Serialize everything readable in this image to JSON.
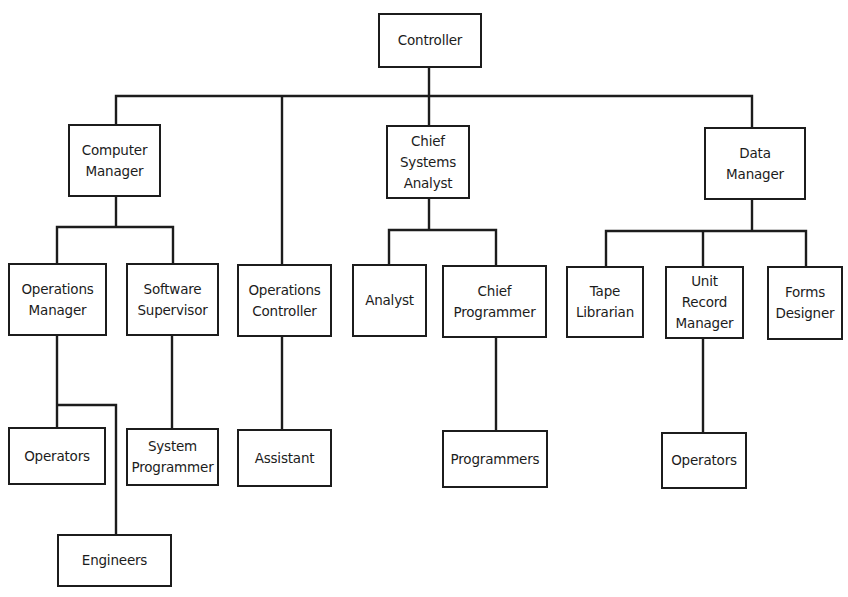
{
  "colors": {
    "line": "#1c1c1c",
    "box_border": "#1c1c1c",
    "text": "#1c1c1c",
    "background": "#ffffff"
  },
  "nodes": [
    {
      "id": "controller",
      "label": "Controller",
      "x": 378,
      "y": 13,
      "w": 104,
      "h": 55
    },
    {
      "id": "computer-manager",
      "label": "Computer\nManager",
      "x": 68,
      "y": 124,
      "w": 93,
      "h": 73
    },
    {
      "id": "chief-systems-analyst",
      "label": "Chief\nSystems\nAnalyst",
      "x": 386,
      "y": 125,
      "w": 84,
      "h": 74
    },
    {
      "id": "data-manager",
      "label": "Data\nManager",
      "x": 704,
      "y": 127,
      "w": 102,
      "h": 73
    },
    {
      "id": "operations-manager",
      "label": "Operations\nManager",
      "x": 8,
      "y": 263,
      "w": 99,
      "h": 73
    },
    {
      "id": "software-supervisor",
      "label": "Software\nSupervisor",
      "x": 126,
      "y": 263,
      "w": 93,
      "h": 73
    },
    {
      "id": "operations-controller",
      "label": "Operations\nController",
      "x": 237,
      "y": 264,
      "w": 95,
      "h": 73
    },
    {
      "id": "analyst",
      "label": "Analyst",
      "x": 352,
      "y": 264,
      "w": 75,
      "h": 73
    },
    {
      "id": "chief-programmer",
      "label": "Chief\nProgrammer",
      "x": 442,
      "y": 265,
      "w": 105,
      "h": 73
    },
    {
      "id": "tape-librarian",
      "label": "Tape\nLibrarian",
      "x": 566,
      "y": 266,
      "w": 78,
      "h": 72
    },
    {
      "id": "unit-record-manager",
      "label": "Unit\nRecord\nManager",
      "x": 665,
      "y": 266,
      "w": 79,
      "h": 73
    },
    {
      "id": "forms-designer",
      "label": "Forms\nDesigner",
      "x": 767,
      "y": 266,
      "w": 76,
      "h": 74
    },
    {
      "id": "operators-computer",
      "label": "Operators",
      "x": 8,
      "y": 427,
      "w": 98,
      "h": 58
    },
    {
      "id": "system-programmer",
      "label": "System\nProgrammer",
      "x": 126,
      "y": 428,
      "w": 93,
      "h": 58
    },
    {
      "id": "assistant",
      "label": "Assistant",
      "x": 237,
      "y": 429,
      "w": 95,
      "h": 58
    },
    {
      "id": "programmers",
      "label": "Programmers",
      "x": 442,
      "y": 430,
      "w": 106,
      "h": 58
    },
    {
      "id": "operators-data",
      "label": "Operators",
      "x": 661,
      "y": 432,
      "w": 86,
      "h": 57
    },
    {
      "id": "engineers",
      "label": "Engineers",
      "x": 57,
      "y": 534,
      "w": 115,
      "h": 53
    }
  ],
  "edges": [
    {
      "from": "controller",
      "to": "computer-manager"
    },
    {
      "from": "controller",
      "to": "operations-controller"
    },
    {
      "from": "controller",
      "to": "chief-systems-analyst"
    },
    {
      "from": "controller",
      "to": "data-manager"
    },
    {
      "from": "computer-manager",
      "to": "operations-manager"
    },
    {
      "from": "computer-manager",
      "to": "software-supervisor"
    },
    {
      "from": "operations-manager",
      "to": "operators-computer"
    },
    {
      "from": "operations-manager",
      "to": "engineers"
    },
    {
      "from": "software-supervisor",
      "to": "system-programmer"
    },
    {
      "from": "operations-controller",
      "to": "assistant"
    },
    {
      "from": "chief-systems-analyst",
      "to": "analyst"
    },
    {
      "from": "chief-systems-analyst",
      "to": "chief-programmer"
    },
    {
      "from": "chief-programmer",
      "to": "programmers"
    },
    {
      "from": "data-manager",
      "to": "tape-librarian"
    },
    {
      "from": "data-manager",
      "to": "unit-record-manager"
    },
    {
      "from": "data-manager",
      "to": "forms-designer"
    },
    {
      "from": "unit-record-manager",
      "to": "operators-data"
    }
  ],
  "connector_polylines": [
    [
      [
        429,
        68
      ],
      [
        429,
        96
      ]
    ],
    [
      [
        116,
        124
      ],
      [
        116,
        96
      ],
      [
        752,
        96
      ],
      [
        752,
        127
      ]
    ],
    [
      [
        282,
        96
      ],
      [
        282,
        264
      ]
    ],
    [
      [
        429,
        96
      ],
      [
        429,
        125
      ]
    ],
    [
      [
        116,
        197
      ],
      [
        116,
        227
      ]
    ],
    [
      [
        57,
        263
      ],
      [
        57,
        227
      ],
      [
        173,
        227
      ],
      [
        173,
        263
      ]
    ],
    [
      [
        57,
        336
      ],
      [
        57,
        427
      ]
    ],
    [
      [
        57,
        405
      ],
      [
        116,
        405
      ],
      [
        116,
        534
      ]
    ],
    [
      [
        172,
        336
      ],
      [
        172,
        428
      ]
    ],
    [
      [
        282,
        337
      ],
      [
        282,
        429
      ]
    ],
    [
      [
        429,
        199
      ],
      [
        429,
        230
      ]
    ],
    [
      [
        389,
        264
      ],
      [
        389,
        230
      ],
      [
        496,
        230
      ],
      [
        496,
        265
      ]
    ],
    [
      [
        496,
        338
      ],
      [
        496,
        430
      ]
    ],
    [
      [
        752,
        200
      ],
      [
        752,
        231
      ]
    ],
    [
      [
        606,
        266
      ],
      [
        606,
        231
      ],
      [
        806,
        231
      ],
      [
        806,
        266
      ]
    ],
    [
      [
        703,
        231
      ],
      [
        703,
        266
      ]
    ],
    [
      [
        703,
        339
      ],
      [
        703,
        432
      ]
    ]
  ]
}
